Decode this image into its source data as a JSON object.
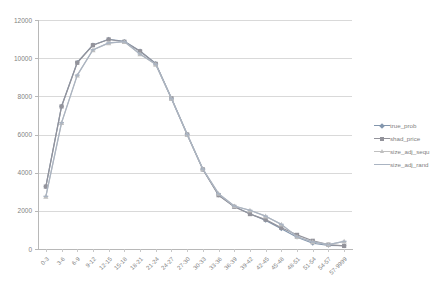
{
  "chart_data": {
    "type": "line",
    "title": "",
    "subtitle": "",
    "xlabel": "",
    "ylabel": "",
    "ylim": [
      0,
      12000
    ],
    "ytick_interval": 2000,
    "ytick_labels": [
      "0",
      "2000",
      "4000",
      "6000",
      "8000",
      "10000",
      "12000"
    ],
    "ytick_values": [
      0,
      2000,
      4000,
      6000,
      8000,
      10000,
      12000
    ],
    "grid": "horizontal",
    "legend_position": "right",
    "categories": [
      "0-3",
      "3-6",
      "6-9",
      "9-12",
      "12-15",
      "15-18",
      "18-21",
      "21-24",
      "24-27",
      "27-30",
      "30-33",
      "33-36",
      "36-39",
      "39-42",
      "42-45",
      "45-48",
      "48-51",
      "51-54",
      "54-57",
      "57-9999"
    ],
    "series": [
      {
        "name": "true_prob",
        "marker": "diamond",
        "color": "#8396ad",
        "values": [
          3270,
          7480,
          9780,
          10690,
          10990,
          10880,
          10380,
          9720,
          7900,
          6010,
          4180,
          2830,
          2230,
          1850,
          1500,
          1060,
          620,
          300,
          190,
          170
        ]
      },
      {
        "name": "shad_price",
        "marker": "square",
        "color": "#93939b",
        "values": [
          3270,
          7470,
          9760,
          10680,
          10980,
          10860,
          10360,
          9700,
          7890,
          6000,
          4170,
          2820,
          2210,
          1830,
          1540,
          1110,
          740,
          430,
          230,
          160
        ]
      },
      {
        "name": "size_adj_sequ",
        "marker": "triangle",
        "color": "#bfbfbf",
        "values": [
          2750,
          6610,
          9100,
          10430,
          10790,
          10860,
          10210,
          9670,
          7880,
          6000,
          4190,
          2900,
          2250,
          2030,
          1720,
          1290,
          640,
          370,
          230,
          400
        ]
      },
      {
        "name": "size_adj_rand",
        "marker": "line",
        "color": "#aab4c2",
        "values": [
          2760,
          6620,
          9110,
          10440,
          10800,
          10870,
          10220,
          9680,
          7880,
          6010,
          4190,
          2900,
          2250,
          2030,
          1720,
          1290,
          640,
          370,
          230,
          400
        ]
      }
    ]
  },
  "legend": {
    "items": [
      {
        "label": "true_prob"
      },
      {
        "label": "shad_price"
      },
      {
        "label": "size_adj_sequ"
      },
      {
        "label": "size_adj_rand"
      }
    ]
  },
  "colors": {
    "gridline": "#d9d9d9",
    "axis": "#b8b8b8",
    "tick_text": "#7f7f7f",
    "background": "#ffffff"
  }
}
